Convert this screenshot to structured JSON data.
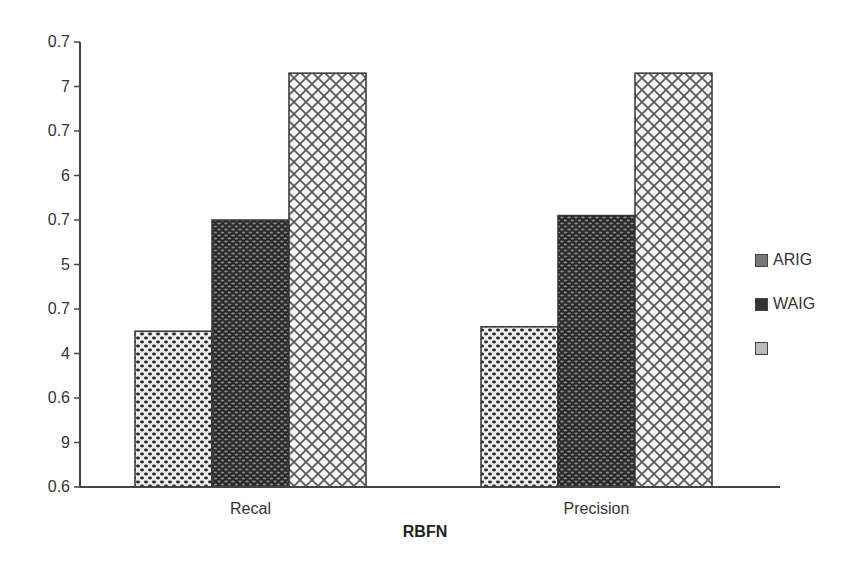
{
  "chart_data": {
    "type": "bar",
    "title": "",
    "xlabel": "RBFN",
    "ylabel": "",
    "categories": [
      "Recal",
      "Precision"
    ],
    "series": [
      {
        "name": "ARIG",
        "values": [
          0.635,
          0.636
        ],
        "pattern": "dots-light"
      },
      {
        "name": "WAIG",
        "values": [
          0.66,
          0.661
        ],
        "pattern": "dots-dark"
      },
      {
        "name": "",
        "values": [
          0.693,
          0.693
        ],
        "pattern": "crosshatch"
      }
    ],
    "ylim": [
      0.6,
      0.7
    ],
    "y_tick_labels": [
      "0.6",
      "9",
      "0.6",
      "4",
      "0.7",
      "5",
      "0.7",
      "6",
      "0.7",
      "7",
      "0.7"
    ],
    "grid": false,
    "legend_position": "right",
    "colors": {
      "axis": "#444444",
      "bar_outline": "#333333",
      "dark_fill": "#2b2b2b",
      "light_fill": "#f2f2f2"
    }
  }
}
